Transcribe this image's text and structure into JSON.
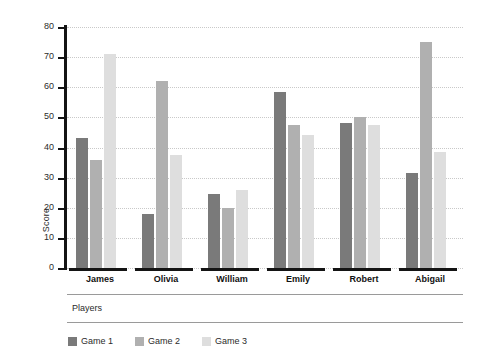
{
  "chart_data": {
    "type": "bar",
    "title": "",
    "xlabel": "Players",
    "ylabel": "Score",
    "categories": [
      "James",
      "Olivia",
      "William",
      "Emily",
      "Robert",
      "Abigail"
    ],
    "series": [
      {
        "name": "Game 1",
        "color": "#7a7a7a",
        "values": [
          43,
          18,
          24.5,
          58.5,
          48,
          31.5
        ]
      },
      {
        "name": "Game 2",
        "color": "#b0b0b0",
        "values": [
          36,
          62,
          20,
          47.5,
          50,
          75
        ]
      },
      {
        "name": "Game 3",
        "color": "#dedede",
        "values": [
          71,
          37.5,
          26,
          44,
          47.5,
          38.5
        ]
      }
    ],
    "ylim": [
      0,
      80
    ],
    "yticks": [
      0,
      10,
      20,
      30,
      40,
      50,
      60,
      70,
      80
    ],
    "grid": true,
    "legend_position": "bottom-left",
    "background": "#ffffff"
  }
}
